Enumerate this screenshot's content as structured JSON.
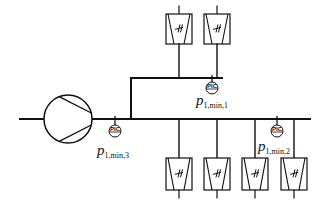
{
  "diagram": {
    "colors": {
      "line": "#111111",
      "background": "#ffffff"
    },
    "compressor": {
      "icon": "compressor-icon",
      "cx": 68,
      "cy": 119,
      "r": 24
    },
    "header": {
      "y": 119,
      "x_start": 20,
      "x_end": 310
    },
    "upper_branch": {
      "x": 131,
      "y": 78,
      "x_end": 222
    },
    "controllers": [
      {
        "id": "pic1",
        "tag": "PIC",
        "cx": 212,
        "cy": 88,
        "tap_y": 78,
        "label_p": "p",
        "label_sub": "1,min,1",
        "label_x": 196,
        "label_y": 92
      },
      {
        "id": "pic2",
        "tag": "PIC",
        "cx": 277,
        "cy": 131,
        "tap_y": 119,
        "label_p": "p",
        "label_sub": "1,min,2",
        "label_x": 258,
        "label_y": 138
      },
      {
        "id": "pic3",
        "tag": "PIC",
        "cx": 115,
        "cy": 131,
        "tap_y": 119,
        "label_p": "p",
        "label_sub": "1,min,3",
        "label_x": 97,
        "label_y": 142
      }
    ],
    "upper_consumers": [
      {
        "x": 179,
        "box_top": 14,
        "box_bottom": 44,
        "line_to": 78
      },
      {
        "x": 217,
        "box_top": 14,
        "box_bottom": 44,
        "line_to": 78
      }
    ],
    "lower_consumers": [
      {
        "x": 179,
        "box_top": 158,
        "box_bottom": 190,
        "line_from": 119
      },
      {
        "x": 217,
        "box_top": 158,
        "box_bottom": 190,
        "line_from": 119
      },
      {
        "x": 255,
        "box_top": 158,
        "box_bottom": 190,
        "line_from": 119
      },
      {
        "x": 294,
        "box_top": 158,
        "box_bottom": 190,
        "line_from": 119
      }
    ]
  }
}
